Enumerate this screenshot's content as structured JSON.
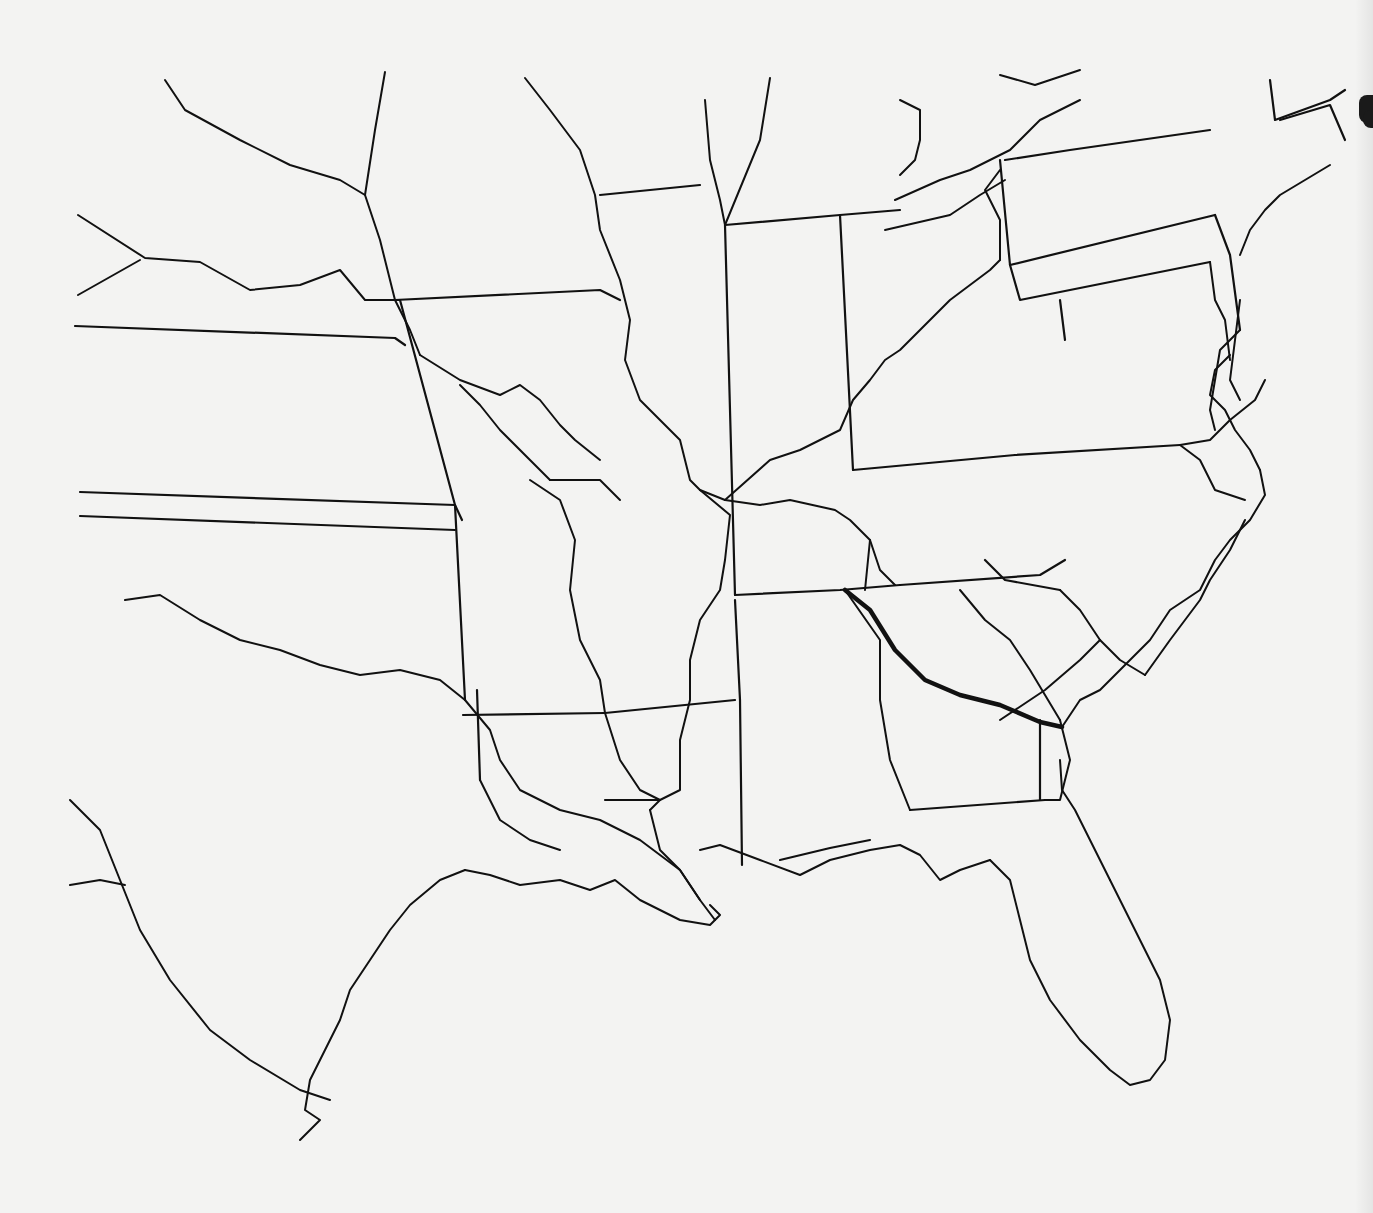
{
  "map": {
    "title": "",
    "background_color": "#f3f3f2",
    "stroke_color": "#111111",
    "border_width": 2.2,
    "river_width": 2.0,
    "route_width": 4.5,
    "route": {
      "name": "bold-route",
      "points": [
        [
          845,
          590
        ],
        [
          870,
          610
        ],
        [
          895,
          650
        ],
        [
          925,
          680
        ],
        [
          960,
          695
        ],
        [
          1000,
          705
        ],
        [
          1040,
          722
        ],
        [
          1062,
          727
        ]
      ]
    },
    "layers": [
      {
        "name": "state-borders",
        "paths": [
          "M75,326 L395,338 L405,345",
          "M80,492 L455,505 L462,520",
          "M80,516 L455,530",
          "M395,300 L600,290 L620,300",
          "M600,195 L700,185",
          "M725,225 L840,215 L900,210",
          "M400,300 L455,505",
          "M455,505 L465,700",
          "M725,225 L735,595",
          "M840,215 L853,470",
          "M853,470 L1015,455",
          "M1015,455 L1180,445",
          "M1000,160 L1010,265 L1215,215",
          "M1215,215 L1230,255 L1240,330",
          "M1005,160 L1070,150 L1210,130",
          "M1270,80 L1275,120 L1330,100 L1345,90",
          "M1280,120 L1330,105 L1345,140",
          "M1010,265 L1020,300 L1210,262",
          "M1060,300 L1065,340",
          "M735,595 L840,590 L900,585",
          "M900,585 L1040,575 L1065,560",
          "M463,715 L605,713",
          "M605,713 L735,700",
          "M735,600 L740,700 L742,865",
          "M477,690 L480,780",
          "M605,800 L660,800",
          "M780,860 L830,848 L870,840",
          "M910,810 L1045,800",
          "M1040,720 L1040,800",
          "M985,560 L1005,580 L1060,590"
        ]
      },
      {
        "name": "rivers",
        "paths": [
          "M165,80 L185,110 L240,140 L290,165 L340,180 L365,195 L380,240 L395,300",
          "M395,300 L410,330 L420,355",
          "M365,195 L375,130 L385,72",
          "M78,215 L145,258 L200,262 L250,290 L300,285 L340,270 L365,300 L400,300",
          "M78,295 L140,260",
          "M420,355 L460,380 L500,395 L520,385 L540,400 L560,425 L575,440 L600,460",
          "M460,385 L480,405 L500,430 L530,460 L550,480",
          "M550,480 L600,480 L620,500",
          "M525,78 L550,110 L580,150 L595,195 L600,230 L620,280 L630,320 L625,360 L640,400 L680,440 L690,480 L700,490 L725,500",
          "M700,490 L730,515 L725,560 L720,590 L700,620 L690,660 L690,700 L680,740 L680,790 L660,800 L650,810",
          "M650,810 L660,850 L680,870 L700,900 L715,920",
          "M705,100 L710,160 L720,200 L725,225",
          "M770,78 L760,140 L725,225",
          "M725,500 L770,460 L800,450 L840,430 L853,400 L870,380 L885,360 L900,350 L920,330 L950,300 L990,270 L1000,260",
          "M725,500 L760,505 L790,500 L835,510 L850,520 L870,540 L880,570 L895,585",
          "M1000,260 L1000,220 L985,190 L1000,170",
          "M900,100 L920,110 L920,140 L915,160 L900,175",
          "M895,200 L940,180 L970,170 L1010,150 L1040,120 L1080,100",
          "M885,230 L950,215 L980,195 L1005,180",
          "M1000,75 L1035,85 L1080,70",
          "M125,600 L160,595 L200,620 L240,640 L280,650 L320,665 L360,675 L400,670 L440,680 L465,700",
          "M465,700 L490,730 L500,760 L520,790 L560,810 L600,820 L640,840 L680,870 L700,900",
          "M480,780 L500,820 L530,840 L560,850",
          "M530,480 L560,500 L575,540 L570,590 L580,640 L600,680 L605,713",
          "M605,713 L620,760 L640,790 L660,800",
          "M870,540 L865,590",
          "M845,590 L880,640 L880,700 L890,760 L910,810",
          "M960,590 L985,620 L1010,640 L1030,670 L1060,720",
          "M1060,720 L1065,740 L1070,760 L1060,800 L1045,800",
          "M1060,590 L1080,610 L1100,640 L1120,660 L1145,675",
          "M1145,675 L1170,640 L1185,620 L1200,600 L1210,580 L1230,550 L1245,520",
          "M1180,445 L1210,440 L1230,420 L1255,400 L1265,380",
          "M1180,445 L1200,460 L1215,490 L1245,500",
          "M1240,330 L1220,350 L1215,380 L1210,410 L1215,430",
          "M1210,262 L1215,300 L1225,320 L1230,360",
          "M1000,720 L1045,690 L1080,660 L1100,640"
        ]
      },
      {
        "name": "coastlines",
        "paths": [
          "M465,870 L490,875 L520,885 L560,880 L590,890 L615,880 L640,900 L680,920 L710,925 L720,915 L710,905",
          "M700,850 L720,845 L760,860 L800,875 L830,860 L870,850 L900,845 L920,855 L940,880 L960,870 L990,860",
          "M990,860 L1010,880 L1020,920 L1030,960 L1050,1000 L1080,1040 L1110,1070 L1130,1085 L1150,1080 L1165,1060 L1170,1020 L1160,980 L1140,940 L1120,900 L1110,880",
          "M1110,880 L1090,840 L1075,810 L1062,790 L1060,760",
          "M1062,727 L1080,700 L1100,690 L1130,660 L1150,640 L1170,610 L1200,590 L1215,560 L1230,540 L1250,520 L1265,495 L1260,470",
          "M1260,470 L1250,450 L1235,430 L1225,410 L1210,395 L1215,370 L1230,355",
          "M1240,300 L1235,340 L1230,380 L1240,400",
          "M1240,255 L1250,230 L1265,210 L1280,195 L1305,180 L1330,165",
          "M465,870 L440,880 L410,905 L390,930 L370,960 L350,990 L340,1020 L325,1050 L310,1080 L305,1110 L320,1120 L300,1140",
          "M70,800 L100,830 L120,880 L140,930 L170,980 L210,1030 L250,1060 L300,1090 L330,1100",
          "M70,885 L100,880 L125,885"
        ]
      }
    ]
  }
}
